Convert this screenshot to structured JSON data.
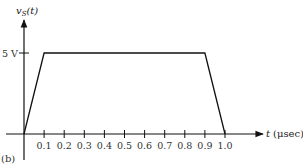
{
  "chart_data": {
    "type": "line",
    "title": "",
    "panel_label": "(b)",
    "ylabel": "v",
    "ylabel_sub": "S",
    "ylabel_arg": "(t)",
    "xlabel_var": "t",
    "xlabel_unit": "(μsec)",
    "y_tick": {
      "value": 5,
      "label": "5 V"
    },
    "x_ticks": [
      0.1,
      0.2,
      0.3,
      0.4,
      0.5,
      0.6,
      0.7,
      0.8,
      0.9,
      1.0
    ],
    "x_tick_labels": [
      "0.1",
      "0.2",
      "0.3",
      "0.4",
      "0.5",
      "0.6",
      "0.7",
      "0.8",
      "0.9",
      "1.0"
    ],
    "xlim": [
      0,
      1.2
    ],
    "ylim": [
      0,
      6
    ],
    "series": [
      {
        "name": "vS(t)",
        "x": [
          0,
          0.1,
          0.9,
          1.0
        ],
        "y": [
          0,
          5,
          5,
          0
        ]
      }
    ],
    "grid": false
  }
}
